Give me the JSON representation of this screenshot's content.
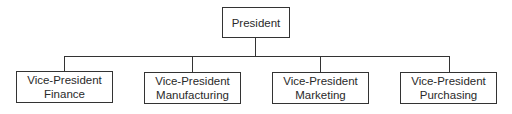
{
  "diagram": {
    "type": "org-chart",
    "root": {
      "label": "President"
    },
    "children": [
      {
        "line1": "Vice-President",
        "line2": "Finance"
      },
      {
        "line1": "Vice-President",
        "line2": "Manufacturing"
      },
      {
        "line1": "Vice-President",
        "line2": "Marketing"
      },
      {
        "line1": "Vice-President",
        "line2": "Purchasing"
      }
    ],
    "colors": {
      "line": "#333333",
      "background": "#ffffff",
      "text": "#2a2a2a"
    }
  }
}
